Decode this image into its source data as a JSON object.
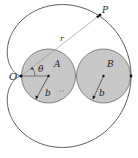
{
  "figure": {
    "colors": {
      "curve": "#555555",
      "circle_fill": "#c8c8c8",
      "circle_stroke": "#6a6a6a",
      "line": "#777777",
      "dot": "#111111"
    },
    "labels": {
      "origin": "O",
      "point": "P",
      "radius_vector": "r",
      "angle": "θ",
      "circle_a": "A",
      "circle_b": "B",
      "radius_a": "b",
      "radius_b": "b"
    },
    "geometry": {
      "origin": [
        21,
        76
      ],
      "b": 27.5,
      "point_P_angle_deg": 37.7
    }
  }
}
